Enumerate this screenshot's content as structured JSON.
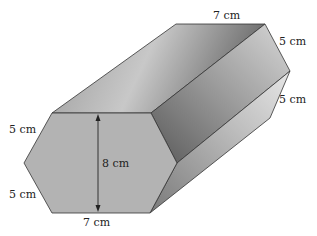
{
  "diagram": {
    "type": "hexagonal-prism",
    "labels": {
      "back_top_edge": "7 cm",
      "back_upper_right_edge": "5 cm",
      "back_lower_right_edge": "5 cm",
      "front_upper_left_edge": "5 cm",
      "front_lower_left_edge": "5 cm",
      "front_bottom_edge": "7 cm",
      "height": "8 cm"
    },
    "colors": {
      "front_face": "#b3b3b3",
      "edge": "#333333",
      "top_face_light": "#d8d8d8",
      "top_face_dark": "#6e6e6e"
    }
  }
}
